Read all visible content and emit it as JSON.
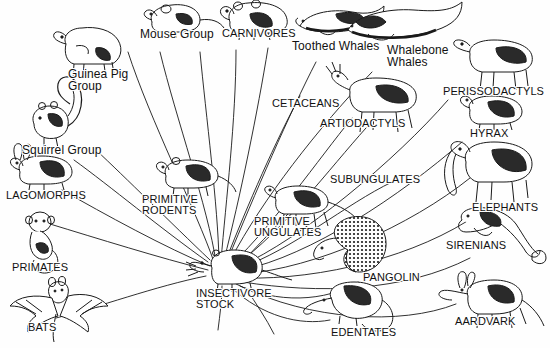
{
  "figure": {
    "type": "evolutionary-radiation-diagram",
    "background_color": "#fefefe",
    "ink_color": "#111111",
    "root": {
      "label": "INSECTIVORE\nSTOCK",
      "label_line1": "INSECTIVORE",
      "label_line2": "STOCK",
      "style": "caps",
      "hub_x": 225,
      "hub_y": 272
    },
    "branches": [
      {
        "id": "guinea-pig-group",
        "label": "Guinea Pig\nGroup",
        "style": "mixed",
        "label_x": 68,
        "label_y": 68,
        "anim_x": 60,
        "anim_y": 30,
        "creature": "capybara"
      },
      {
        "id": "mouse-group",
        "label": "Mouse Group",
        "style": "mixed",
        "label_x": 140,
        "label_y": 28,
        "anim_x": 150,
        "anim_y": 2,
        "creature": "mouse"
      },
      {
        "id": "carnivores",
        "label": "CARNIVORES",
        "style": "caps",
        "label_x": 222,
        "label_y": 28,
        "anim_x": 230,
        "anim_y": 2,
        "creature": "bear"
      },
      {
        "id": "toothed-whales",
        "label": "Toothed Whales",
        "style": "mixed",
        "label_x": 292,
        "label_y": 40,
        "anim_x": 300,
        "anim_y": 8,
        "creature": "sperm-whale"
      },
      {
        "id": "whalebone-whales",
        "label": "Whalebone\nWhales",
        "style": "mixed",
        "label_x": 387,
        "label_y": 44,
        "anim_x": 395,
        "anim_y": 4,
        "creature": "baleen-whale"
      },
      {
        "id": "perissodactyls",
        "label": "PERISSODACTYLS",
        "style": "caps",
        "label_x": 443,
        "label_y": 86,
        "anim_x": 458,
        "anim_y": 40,
        "creature": "tapir"
      },
      {
        "id": "cetaceans",
        "label": "CETACEANS",
        "style": "caps",
        "label_x": 272,
        "label_y": 98,
        "anim_x": 0,
        "anim_y": 0,
        "creature": "none"
      },
      {
        "id": "artiodactyls",
        "label": "ARTIODACTYLS",
        "style": "caps",
        "label_x": 320,
        "label_y": 118,
        "anim_x": 355,
        "anim_y": 80,
        "creature": "deer"
      },
      {
        "id": "hyrax",
        "label": "HYRAX",
        "style": "caps",
        "label_x": 470,
        "label_y": 128,
        "anim_x": 467,
        "anim_y": 98,
        "creature": "hyrax"
      },
      {
        "id": "squirrel-group",
        "label": "Squirrel Group",
        "style": "mixed",
        "label_x": 22,
        "label_y": 144,
        "anim_x": 30,
        "anim_y": 104,
        "creature": "squirrel"
      },
      {
        "id": "subungulates",
        "label": "SUBUNGULATES",
        "style": "caps",
        "label_x": 330,
        "label_y": 174,
        "anim_x": 0,
        "anim_y": 0,
        "creature": "none"
      },
      {
        "id": "lagomorphs",
        "label": "LAGOMORPHS",
        "style": "caps",
        "label_x": 6,
        "label_y": 190,
        "anim_x": 12,
        "anim_y": 158,
        "creature": "rabbit"
      },
      {
        "id": "primitive-rodents",
        "label": "PRIMITIVE\nRODENTS",
        "style": "caps",
        "label_x": 142,
        "label_y": 194,
        "anim_x": 160,
        "anim_y": 158,
        "creature": "primitive-rodent"
      },
      {
        "id": "elephants",
        "label": "ELEPHANTS",
        "style": "caps",
        "label_x": 472,
        "label_y": 202,
        "anim_x": 460,
        "anim_y": 150,
        "creature": "elephant"
      },
      {
        "id": "primitive-ungulates",
        "label": "PRIMITIVE\nUNGULATES",
        "style": "caps",
        "label_x": 254,
        "label_y": 216,
        "anim_x": 270,
        "anim_y": 190,
        "creature": "condylarth"
      },
      {
        "id": "primates",
        "label": "PRIMATES",
        "style": "caps",
        "label_x": 12,
        "label_y": 262,
        "anim_x": 22,
        "anim_y": 212,
        "creature": "monkey"
      },
      {
        "id": "sirenians",
        "label": "SIRENIANS",
        "style": "caps",
        "label_x": 446,
        "label_y": 240,
        "anim_x": 470,
        "anim_y": 206,
        "creature": "manatee"
      },
      {
        "id": "pangolin",
        "label": "PANGOLIN",
        "style": "caps",
        "label_x": 363,
        "label_y": 272,
        "anim_x": 345,
        "anim_y": 228,
        "creature": "pangolin"
      },
      {
        "id": "bats",
        "label": "BATS",
        "style": "caps",
        "label_x": 28,
        "label_y": 322,
        "anim_x": 14,
        "anim_y": 278,
        "creature": "bat"
      },
      {
        "id": "edentates",
        "label": "EDENTATES",
        "style": "caps",
        "label_x": 331,
        "label_y": 327,
        "anim_x": 330,
        "anim_y": 284,
        "creature": "anteater"
      },
      {
        "id": "aardvark",
        "label": "AARDVARK",
        "style": "caps",
        "label_x": 455,
        "label_y": 316,
        "anim_x": 450,
        "anim_y": 272,
        "creature": "aardvark"
      }
    ]
  }
}
